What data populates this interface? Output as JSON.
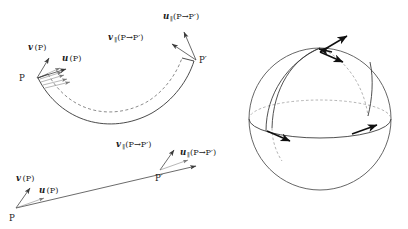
{
  "figure": {
    "background_color": "#ffffff",
    "ink_color": "#1a1a1a",
    "dashed_color": "#9a9a9a",
    "panels": [
      {
        "id": "curved-path-panel",
        "name": "curved-path-diagram",
        "description": "Vectors v(P) and u(P) at point P transported along a curved ribbon to point P-prime"
      },
      {
        "id": "straight-path-panel",
        "name": "straight-path-diagram",
        "description": "Vectors v(P) and u(P) at point P transported along a straight line to point P-prime"
      },
      {
        "id": "sphere-panel",
        "name": "sphere-diagram",
        "description": "Sphere with equator, two meridians and tangent vectors at the north pole and on the equator"
      }
    ],
    "labels": {
      "v_at_p": {
        "symbol": "v",
        "sub": "",
        "arg": "(P)"
      },
      "u_at_p": {
        "symbol": "u",
        "sub": "",
        "arg": "(P)"
      },
      "v_transported": {
        "symbol": "v",
        "sub": "∥",
        "arg": "(P→P′)"
      },
      "u_transported": {
        "symbol": "u",
        "sub": "∥",
        "arg": "(P→P′)"
      },
      "point_p": "P",
      "point_p_prime": "P′"
    },
    "panel_curved": {
      "v_symbol": "v",
      "v_sub": "",
      "v_arg": "(P)",
      "u_symbol": "u",
      "u_sub": "",
      "u_arg": "(P)",
      "vpar_symbol": "v",
      "vpar_sub": "∥",
      "vpar_arg": "(P→P′)",
      "upar_symbol": "u",
      "upar_sub": "∥",
      "upar_arg": "(P→P′)",
      "p_label": "P",
      "p_prime_label": "P′"
    },
    "panel_straight": {
      "v_symbol": "v",
      "v_sub": "",
      "v_arg": "(P)",
      "u_symbol": "u",
      "u_sub": "",
      "u_arg": "(P)",
      "vpar_symbol": "v",
      "vpar_sub": "∥",
      "vpar_arg": "(P→P′)",
      "upar_symbol": "u",
      "upar_sub": "∥",
      "upar_arg": "(P→P′)",
      "p_label": "P",
      "p_prime_label": "P′"
    },
    "panel_sphere": {
      "arrow_count": 4,
      "meridian_count": 2,
      "equator_label": "",
      "pole_label": ""
    }
  }
}
